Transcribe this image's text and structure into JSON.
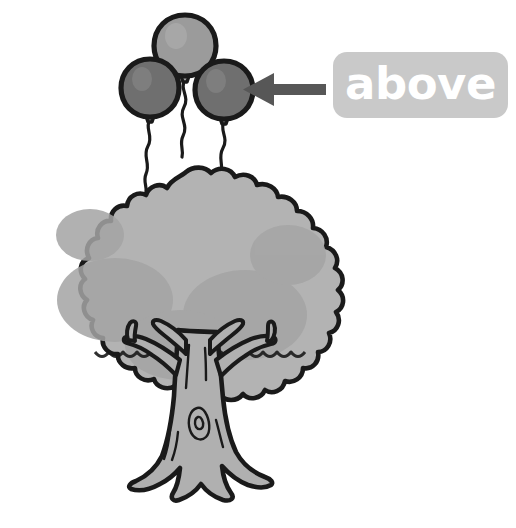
{
  "illustration": {
    "title": "above",
    "subject": "tree-with-balloons",
    "background_color": "#ffffff",
    "description_text": "above"
  },
  "callout": {
    "label": "above",
    "box_color": "#c9c9c9",
    "text_color": "#ffffff",
    "arrow_color": "#575757",
    "arrow_direction": "left",
    "points_to": "balloons"
  },
  "balloons": {
    "count": 3,
    "items": [
      {
        "name": "top-balloon",
        "fill": "#9b9b9b",
        "outline": "#1a1a1a",
        "cx": 185,
        "cy": 46,
        "rx": 30,
        "ry": 31
      },
      {
        "name": "left-balloon",
        "fill": "#6f6f6f",
        "outline": "#1a1a1a",
        "cx": 150,
        "cy": 88,
        "rx": 28,
        "ry": 29
      },
      {
        "name": "right-balloon",
        "fill": "#6f6f6f",
        "outline": "#1a1a1a",
        "cx": 224,
        "cy": 90,
        "rx": 28,
        "ry": 29
      }
    ],
    "string_color": "#1a1a1a"
  },
  "tree": {
    "name": "tree",
    "canopy": {
      "fill": "#b3b3b3",
      "shade_fill": "#a1a1a1",
      "outline": "#1a1a1a",
      "bounds": {
        "x": 25,
        "y": 170,
        "width": 322,
        "height": 245
      }
    },
    "trunk": {
      "fill": "#b0b0b0",
      "outline": "#1a1a1a",
      "bounds": {
        "x": 128,
        "y": 330,
        "width": 130,
        "height": 175
      }
    }
  },
  "colors": {
    "ink": "#1a1a1a",
    "canopy": "#b3b3b3",
    "canopy_shade": "#a1a1a1",
    "trunk": "#b0b0b0",
    "balloon_dark": "#6f6f6f",
    "balloon_light": "#9b9b9b",
    "label_box": "#c9c9c9",
    "arrow": "#575757",
    "background": "#ffffff"
  }
}
